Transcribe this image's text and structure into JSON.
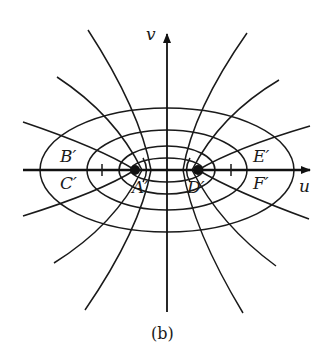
{
  "figure": {
    "caption": "(b)",
    "axes": {
      "horizontal": "u",
      "vertical": "v"
    },
    "points": [
      {
        "id": "A",
        "label": "A′"
      },
      {
        "id": "D",
        "label": "D′"
      }
    ],
    "regions": [
      {
        "id": "B",
        "label": "B′"
      },
      {
        "id": "C",
        "label": "C′"
      },
      {
        "id": "E",
        "label": "E′"
      },
      {
        "id": "F",
        "label": "F′"
      }
    ],
    "ellipse_count": 4,
    "hyperbola_branch_count": 14,
    "line_color": "#1a1a1a"
  }
}
